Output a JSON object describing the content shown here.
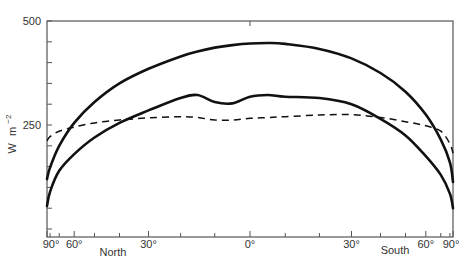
{
  "chart_data": {
    "type": "line",
    "title": "",
    "xlabel": "",
    "ylabel": "W m^-2",
    "ylabel_parts": {
      "unit": "W",
      "m": "m",
      "exp": "−2"
    },
    "ylim": [
      -20,
      500
    ],
    "yticks_labeled": [
      250,
      500
    ],
    "ytick_step": 50,
    "x_scale": "sine of latitude",
    "xlim": [
      -90,
      90
    ],
    "xtick_labels": [
      {
        "lat": -90,
        "label": "90°"
      },
      {
        "lat": -60,
        "label": "60°"
      },
      {
        "lat": -30,
        "label": "30°"
      },
      {
        "lat": 0,
        "label": "0°"
      },
      {
        "lat": 30,
        "label": "30°"
      },
      {
        "lat": 60,
        "label": "60°"
      },
      {
        "lat": 90,
        "label": "90°"
      }
    ],
    "hemisphere_labels": {
      "north": "North",
      "south": "South"
    },
    "grid": false,
    "legend": null,
    "x": [
      -90,
      -80,
      -70,
      -60,
      -50,
      -40,
      -30,
      -20,
      -15,
      -10,
      -5,
      0,
      5,
      10,
      20,
      30,
      40,
      50,
      60,
      70,
      80,
      90
    ],
    "series": [
      {
        "name": "upper solid curve",
        "style": "solid",
        "values": [
          120,
          148,
          200,
          255,
          305,
          350,
          385,
          415,
          427,
          436,
          442,
          446,
          447,
          445,
          433,
          410,
          375,
          330,
          275,
          215,
          160,
          113
        ]
      },
      {
        "name": "lower solid curve",
        "style": "solid",
        "values": [
          55,
          90,
          140,
          180,
          220,
          255,
          285,
          315,
          322,
          305,
          302,
          318,
          322,
          318,
          315,
          300,
          265,
          225,
          175,
          130,
          85,
          50
        ]
      },
      {
        "name": "dashed curve",
        "style": "dashed",
        "values": [
          212,
          222,
          235,
          245,
          255,
          262,
          267,
          270,
          268,
          262,
          262,
          266,
          268,
          270,
          274,
          275,
          268,
          258,
          248,
          235,
          205,
          182
        ]
      }
    ]
  }
}
